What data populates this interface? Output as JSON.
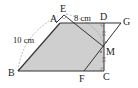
{
  "diagram": {
    "type": "geometry",
    "points": {
      "A": {
        "label": "A",
        "x": 60,
        "y": 23
      },
      "B": {
        "label": "B",
        "x": 18,
        "y": 71
      },
      "C": {
        "label": "C",
        "x": 104,
        "y": 71
      },
      "D": {
        "label": "D",
        "x": 104,
        "y": 23
      },
      "E": {
        "label": "E",
        "x": 64,
        "y": 14
      },
      "F": {
        "label": "F",
        "x": 84,
        "y": 71
      },
      "G": {
        "label": "G",
        "x": 121,
        "y": 23
      },
      "M": {
        "label": "M",
        "x": 104,
        "y": 47
      }
    },
    "measurements": {
      "ED": "8 cm",
      "AB": "10 cm"
    },
    "colors": {
      "fill": "#cfcfcf",
      "line": "#333333",
      "dashed": "#888888"
    }
  }
}
